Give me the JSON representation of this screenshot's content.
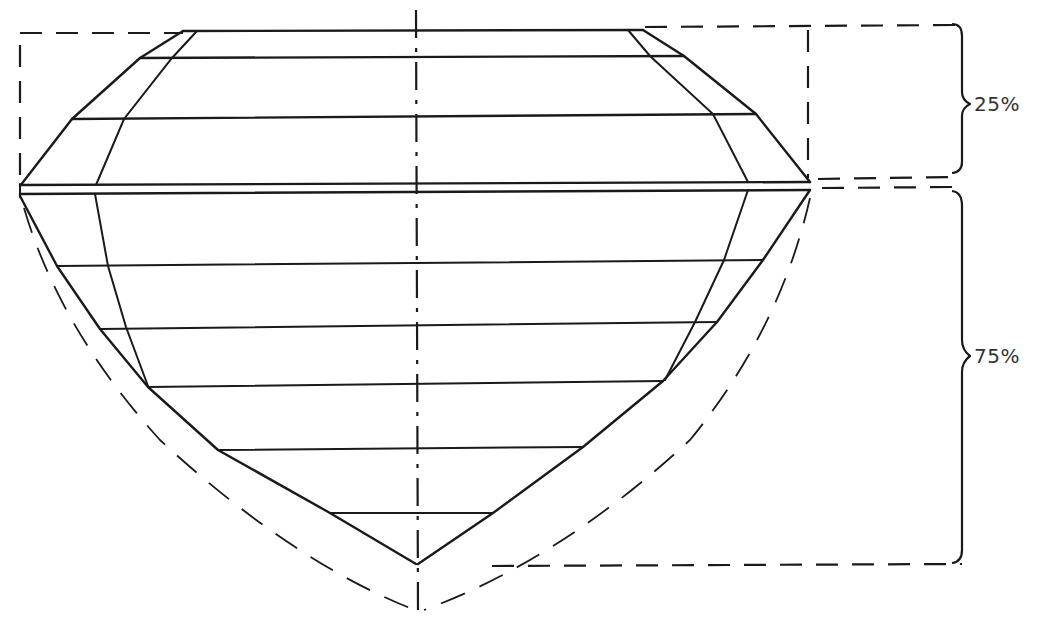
{
  "diagram": {
    "colors": {
      "line": "#1a1a1a",
      "label": "#333333",
      "background": "#ffffff"
    },
    "labels": {
      "crown_percent": "25%",
      "pavilion_percent": "75%"
    },
    "sections": [
      {
        "name": "crown",
        "share": "25%"
      },
      {
        "name": "pavilion",
        "share": "75%"
      }
    ]
  }
}
